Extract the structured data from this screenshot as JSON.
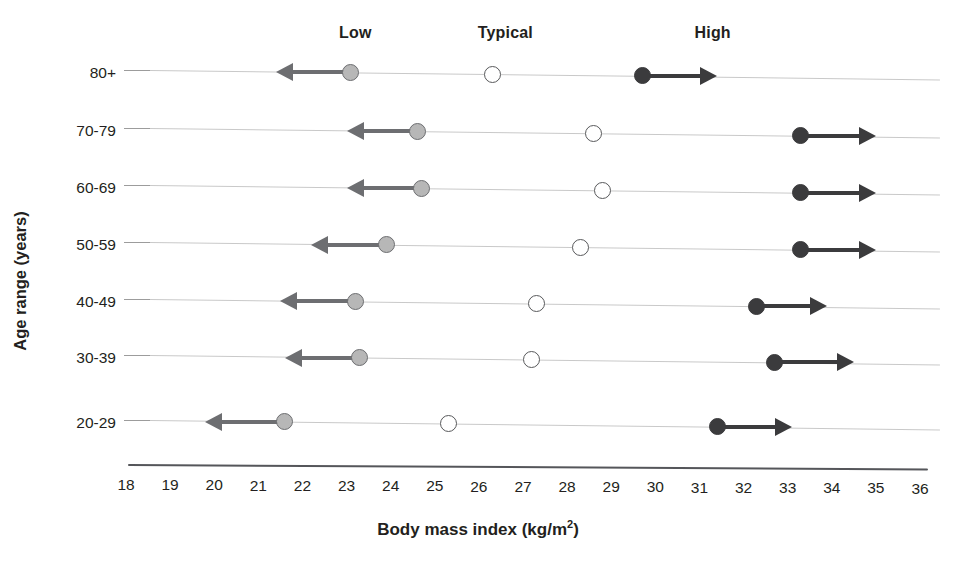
{
  "chart_data": {
    "type": "scatter",
    "title": "",
    "xlabel": "Body mass index (kg/m2)",
    "xlabel_base": "Body mass index (kg/m",
    "xlabel_sup": "2",
    "xlabel_tail": ")",
    "ylabel": "Age range (years)",
    "xlim": [
      18,
      36
    ],
    "xticks": [
      18,
      19,
      20,
      21,
      22,
      23,
      24,
      25,
      26,
      27,
      28,
      29,
      30,
      31,
      32,
      33,
      34,
      35,
      36
    ],
    "xtick_labels": [
      "18",
      "19",
      "20",
      "21",
      "22",
      "23",
      "24",
      "25",
      "26",
      "27",
      "28",
      "29",
      "30",
      "31",
      "32",
      "33",
      "34",
      "35",
      "36"
    ],
    "categories": [
      "80+",
      "70-79",
      "60-69",
      "50-59",
      "40-49",
      "30-39",
      "20-29"
    ],
    "grid": false,
    "legend_position": "top",
    "group_labels": [
      "Low",
      "Typical",
      "High"
    ],
    "group_label_x": [
      23.2,
      26.6,
      31.3
    ],
    "series": [
      {
        "name": "Low",
        "marker": "filled-gray-circle",
        "color": "#b7b7b7",
        "arrow_direction": "left",
        "values": [
          23.1,
          24.6,
          24.7,
          23.9,
          23.2,
          23.3,
          21.6
        ],
        "arrow_tips": [
          21.4,
          23.0,
          23.0,
          22.2,
          21.5,
          21.6,
          19.8
        ]
      },
      {
        "name": "Typical",
        "marker": "open-circle",
        "color": "#ffffff",
        "arrow_direction": "none",
        "values": [
          26.3,
          28.6,
          28.8,
          28.3,
          27.3,
          27.2,
          25.3
        ],
        "arrow_tips": [
          null,
          null,
          null,
          null,
          null,
          null,
          null
        ]
      },
      {
        "name": "High",
        "marker": "filled-dark-circle",
        "color": "#3b3b3d",
        "arrow_direction": "right",
        "values": [
          29.7,
          33.3,
          33.3,
          33.3,
          32.3,
          32.7,
          31.4
        ],
        "arrow_tips": [
          31.4,
          35.0,
          35.0,
          35.0,
          33.9,
          34.5,
          33.1
        ]
      }
    ]
  },
  "colors": {
    "low": "#b7b7b7",
    "low_stroke": "#6d6e71",
    "typical": "#ffffff",
    "typical_stroke": "#58595b",
    "high": "#3b3b3d",
    "row_line": "#c9c9c9",
    "axis": "#55565a",
    "text": "#231f20"
  }
}
